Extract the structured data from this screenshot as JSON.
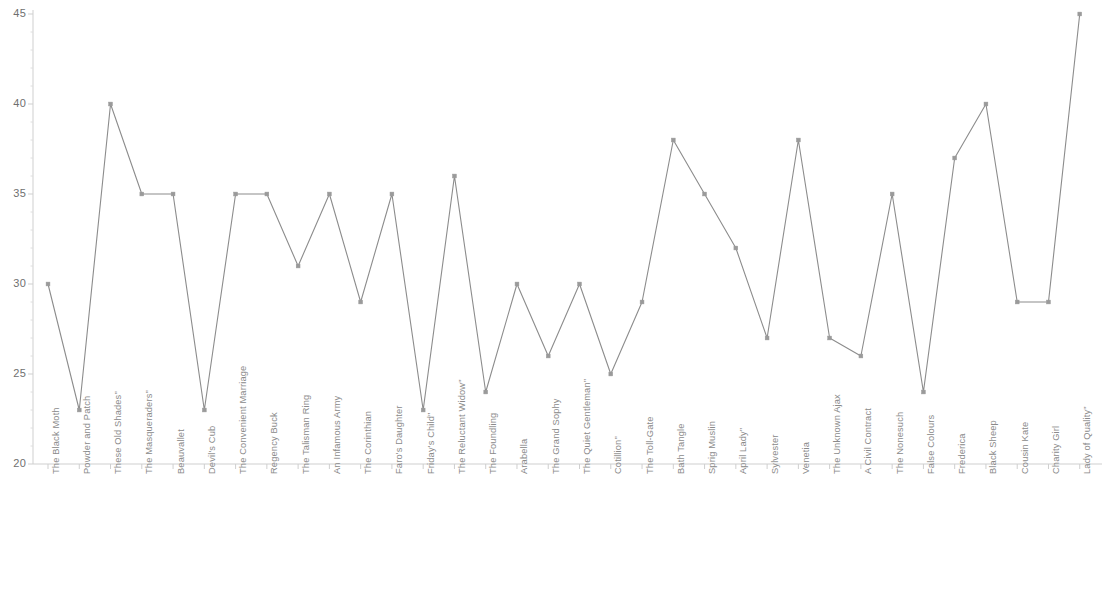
{
  "chart_data": {
    "type": "line",
    "title": "",
    "subtitle": "",
    "xlabel": "",
    "ylabel": "",
    "ylim": [
      20,
      45
    ],
    "y_ticks": [
      20,
      25,
      30,
      35,
      40,
      45
    ],
    "grid": false,
    "legend": "none",
    "marker": "square",
    "line_color": "#8c8c8c",
    "marker_color": "#9a9a9a",
    "axis_color": "#cfcfcf",
    "categories": [
      "The Black Moth",
      "Powder and Patch",
      "These Old Shades\"",
      "The Masqueraders\"",
      "Beauvallet",
      "Devil's Cub",
      "The Convenient Marriage",
      "Regency Buck",
      "The Talisman Ring",
      "An Infamous Army",
      "The Corinthian",
      "Faro's Daughter",
      "Friday's Child\"",
      "The Reluctant Widow\"",
      "The Foundling",
      "Arabella",
      "The Grand Sophy",
      "The Quiet Gentleman\"",
      "Cotillion\"",
      "The Toll-Gate",
      "Bath Tangle",
      "Sprig Muslin",
      "April Lady\"",
      "Sylvester",
      "Venetia",
      "The Unknown Ajax",
      "A Civil Contract",
      "The Nonesuch",
      "False Colours",
      "Frederica",
      "Black Sheep",
      "Cousin Kate",
      "Charity Girl",
      "Lady of Quality\""
    ],
    "values": [
      30,
      23,
      40,
      35,
      35,
      23,
      35,
      35,
      31,
      35,
      29,
      35,
      23,
      36,
      24,
      30,
      26,
      30,
      25,
      29,
      38,
      35,
      32,
      27,
      38,
      27,
      26,
      35,
      24,
      37,
      40,
      29,
      29,
      45
    ]
  }
}
